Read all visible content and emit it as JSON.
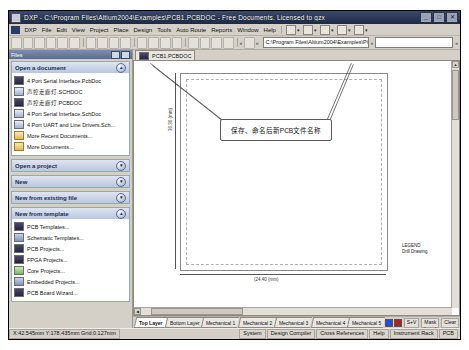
{
  "window": {
    "title": "DXP - C:\\Program Files\\Altium2004\\Examples\\PCB1.PCBDOC - Free Documents. Licensed to gzx",
    "minimize_label": "_",
    "maximize_label": "□",
    "close_label": "✕",
    "icon_name": "dxp-app-icon"
  },
  "menubar": {
    "items": [
      {
        "label": "DXP"
      },
      {
        "label": "File"
      },
      {
        "label": "Edit"
      },
      {
        "label": "View"
      },
      {
        "label": "Project"
      },
      {
        "label": "Place"
      },
      {
        "label": "Design"
      },
      {
        "label": "Tools"
      },
      {
        "label": "Auto Route"
      },
      {
        "label": "Reports"
      },
      {
        "label": "Window"
      },
      {
        "label": "Help"
      }
    ]
  },
  "toolbar": {
    "address_value": "C:\\Program Files\\Altium2004\\Examples\\PCB1.",
    "address_caret": "▾"
  },
  "sidebar": {
    "panel_title": "Files",
    "sections": [
      {
        "title": "Open a document",
        "expanded": true,
        "items": [
          {
            "label": "4 Port Serial Interface.PcbDoc",
            "icon": "pcb-file-icon"
          },
          {
            "label": "声控走廊灯.SCHDOC",
            "icon": "sch-file-icon"
          },
          {
            "label": "声控走廊灯.PCBDOC",
            "icon": "pcb-file-icon"
          },
          {
            "label": "4 Port Serial Interface.SchDoc",
            "icon": "sch-file-icon"
          },
          {
            "label": "4 Port UART and Line Drivers.Sch...",
            "icon": "sch-file-icon"
          },
          {
            "label": "More Recent Documents...",
            "icon": "folder-icon"
          },
          {
            "label": "More Documents...",
            "icon": "folder-icon"
          }
        ]
      },
      {
        "title": "Open a project",
        "expanded": false,
        "items": []
      },
      {
        "title": "New",
        "expanded": false,
        "items": []
      },
      {
        "title": "New from existing file",
        "expanded": false,
        "items": []
      },
      {
        "title": "New from template",
        "expanded": true,
        "items": [
          {
            "label": "PCB Templates...",
            "icon": "pcb-template-icon"
          },
          {
            "label": "Schematic Templates...",
            "icon": "sch-template-icon"
          },
          {
            "label": "PCB Projects...",
            "icon": "pcb-project-icon"
          },
          {
            "label": "FPGA Projects...",
            "icon": "fpga-project-icon"
          },
          {
            "label": "Core Projects...",
            "icon": "core-project-icon"
          },
          {
            "label": "Embedded Projects...",
            "icon": "embedded-project-icon"
          },
          {
            "label": "PCB Board Wizard...",
            "icon": "pcb-wizard-icon"
          }
        ]
      }
    ]
  },
  "editor": {
    "document_tab": "PCB1.PCBDOC",
    "callout_text": "保存、命名后新PCB文件名称",
    "dim_vertical": "36.30 (mm)",
    "dim_horizontal": "(24.40 (mm)",
    "legend_line1": "LEGEND",
    "legend_line2": "Drill Drawing"
  },
  "layerbar": {
    "tabs": [
      {
        "label": "Top Layer",
        "active": true
      },
      {
        "label": "Bottom Layer",
        "active": false
      },
      {
        "label": "Mechanical 1",
        "active": false
      },
      {
        "label": "Mechanical 2",
        "active": false
      },
      {
        "label": "Mechanical 3",
        "active": false
      },
      {
        "label": "Mechanical 4",
        "active": false
      },
      {
        "label": "Mechanical 5",
        "active": false
      }
    ],
    "sv_label": "S+V",
    "mask_label": "Mask Level",
    "clear_label": "Clear"
  },
  "statusbar": {
    "coords": "X:42.545mm Y:178.435mm   Grid:0.127mm",
    "panels": [
      {
        "label": "System"
      },
      {
        "label": "Design Compiler"
      },
      {
        "label": "Cross References"
      },
      {
        "label": "Help"
      },
      {
        "label": "Instrument Rack"
      },
      {
        "label": "PCB"
      }
    ]
  },
  "colors": {
    "titlebar_start": "#3a4a6b",
    "titlebar_end": "#1c2a45",
    "chrome": "#d4d0c8",
    "section_header": "#b9c6de",
    "canvas": "#ffffff",
    "grid_line": "#c9c9c9"
  }
}
